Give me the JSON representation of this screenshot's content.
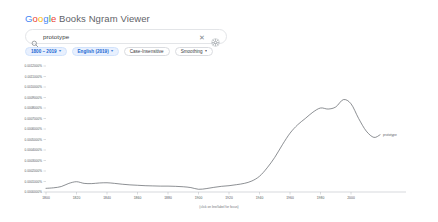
{
  "header": {
    "brand_google": "Google",
    "brand_rest": " Books Ngram Viewer"
  },
  "search": {
    "value": "prototype",
    "placeholder": "Search in Google Books Ngram Viewer",
    "search_icon": "search-icon",
    "clear_icon": "close-icon",
    "clear_glyph": "✕",
    "settings_icon": "gear-icon"
  },
  "controls": {
    "chips": [
      {
        "label": "1800 – 2019",
        "has_caret": true,
        "filled": true
      },
      {
        "label": "English (2019)",
        "has_caret": true,
        "filled": true
      },
      {
        "label": "Case-Insensitive",
        "has_caret": false,
        "filled": false
      },
      {
        "label": "Smoothing",
        "has_caret": true,
        "filled": false
      }
    ],
    "caret_glyph": "▾"
  },
  "chart_data": {
    "type": "line",
    "title": "",
    "xlabel": "",
    "ylabel": "",
    "caption": "(click on line/label for focus)",
    "grid": false,
    "legend_position": "right-inline",
    "xlim": [
      1800,
      2019
    ],
    "ylim": [
      0.0,
      0.0012
    ],
    "x_ticks": [
      1800,
      1820,
      1840,
      1860,
      1880,
      1900,
      1920,
      1940,
      1960,
      1980,
      2000
    ],
    "x_tick_labels": [
      "1800",
      "1820",
      "1840",
      "1860",
      "1880",
      "1900",
      "1920",
      "1940",
      "1960",
      "1980",
      "2000"
    ],
    "y_ticks": [
      0.0,
      0.0001,
      0.0002,
      0.0003,
      0.0004,
      0.0005,
      0.0006,
      0.0007,
      0.0008,
      0.0009,
      0.001,
      0.0011,
      0.0012
    ],
    "y_tick_labels": [
      "0.0000000%",
      "0.0001000%",
      "0.0002000%",
      "0.0003000%",
      "0.0004000%",
      "0.0005000%",
      "0.0006000%",
      "0.0007000%",
      "0.0008000%",
      "0.0009000%",
      "0.0010000%",
      "0.0011000%",
      "0.0012000%"
    ],
    "series": [
      {
        "name": "prototype",
        "color": "#5b6066",
        "x": [
          1800,
          1805,
          1810,
          1815,
          1820,
          1825,
          1830,
          1835,
          1840,
          1845,
          1850,
          1855,
          1860,
          1865,
          1870,
          1875,
          1880,
          1885,
          1890,
          1895,
          1900,
          1905,
          1910,
          1915,
          1920,
          1925,
          1930,
          1935,
          1940,
          1945,
          1950,
          1955,
          1960,
          1965,
          1970,
          1975,
          1980,
          1985,
          1990,
          1995,
          2000,
          2005,
          2010,
          2015,
          2019
        ],
        "values": [
          3.5e-05,
          4e-05,
          5.2e-05,
          8.2e-05,
          9.8e-05,
          8.2e-05,
          8e-05,
          8.6e-05,
          8.8e-05,
          8.2e-05,
          7.4e-05,
          6.8e-05,
          6.4e-05,
          6e-05,
          5.8e-05,
          5.6e-05,
          5.6e-05,
          5.4e-05,
          5e-05,
          4.2e-05,
          2.6e-05,
          3.2e-05,
          4.4e-05,
          5.4e-05,
          6e-05,
          7e-05,
          8.2e-05,
          0.000105,
          0.00015,
          0.00023,
          0.00033,
          0.00045,
          0.00056,
          0.00064,
          0.0007,
          0.00076,
          0.0008,
          0.00079,
          0.00081,
          0.00088,
          0.00084,
          0.0007,
          0.00058,
          0.00052,
          0.000545
        ]
      }
    ]
  }
}
